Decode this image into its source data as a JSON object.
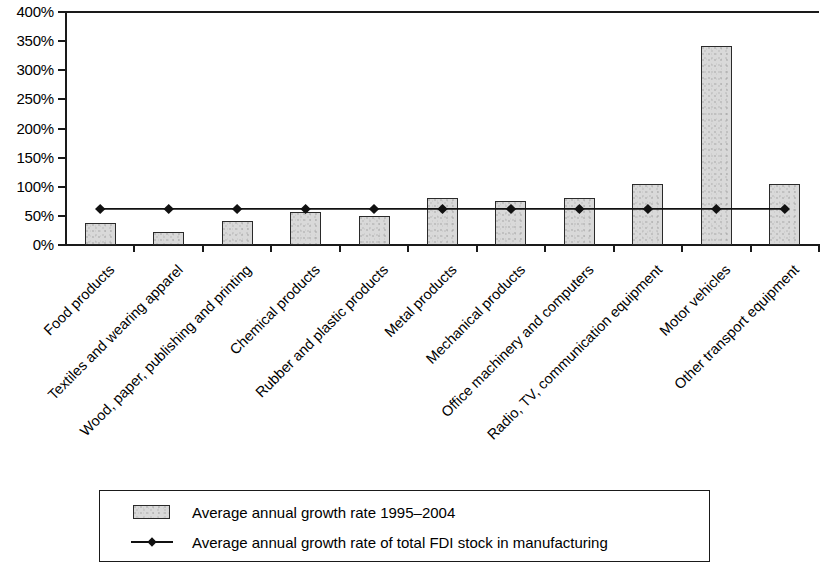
{
  "chart_data": {
    "type": "bar",
    "title": "",
    "subtitle": "",
    "xlabel": "",
    "ylabel": "",
    "ylim": [
      0,
      400
    ],
    "ytick_values": [
      0,
      50,
      100,
      150,
      200,
      250,
      300,
      350,
      400
    ],
    "ytick_labels": [
      "0%",
      "50%",
      "100%",
      "150%",
      "200%",
      "250%",
      "300%",
      "350%",
      "400%"
    ],
    "grid": false,
    "legend_position": "bottom",
    "categories": [
      "Food products",
      "Textiles and wearing apparel",
      "Wood, paper, publishing and printing",
      "Chemical products",
      "Rubber and plastic products",
      "Metal products",
      "Mechanical products",
      "Office machinery and computers",
      "Radio, TV, communication equipment",
      "Motor vehicles",
      "Other transport equipment"
    ],
    "series": [
      {
        "name": "Average annual growth rate 1995–2004",
        "type": "bar",
        "values": [
          38,
          22,
          42,
          57,
          49,
          80,
          75,
          80,
          104,
          341,
          104
        ]
      },
      {
        "name": "Average annual growth rate of total FDI stock in manufacturing",
        "type": "line",
        "marker": "diamond",
        "values": [
          62,
          62,
          62,
          62,
          62,
          62,
          62,
          62,
          62,
          62,
          62
        ]
      }
    ],
    "colors": {
      "bar_fill": "#d9d9d9",
      "bar_edge": "#2a2a2a",
      "line": "#111111",
      "marker": "#111111",
      "axis": "#1a1a1a",
      "text": "#000000",
      "background": "#ffffff"
    }
  },
  "legend": {
    "items": [
      {
        "label": "Average annual growth rate 1995–2004",
        "swatch": "bar-swatch-icon"
      },
      {
        "label": "Average annual growth rate of total FDI stock in manufacturing",
        "swatch": "line-marker-swatch-icon"
      }
    ]
  }
}
